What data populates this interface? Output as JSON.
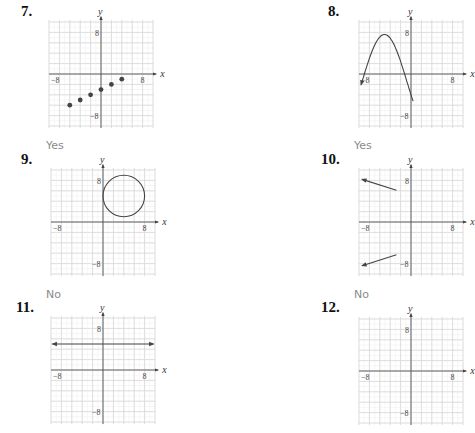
{
  "problems": [
    {
      "number": "7.",
      "answer": "Yes",
      "graph": {
        "type": "scatter",
        "points": [
          [
            -6,
            -6
          ],
          [
            -4,
            -5
          ],
          [
            -2,
            -4
          ],
          [
            0,
            -3
          ],
          [
            2,
            -2
          ],
          [
            4,
            -1
          ]
        ]
      }
    },
    {
      "number": "8.",
      "answer": "Yes",
      "graph": {
        "type": "curve",
        "description": "wave with arrow on left, peak near (-5,8), crossing x-axis near (-1,0)"
      }
    },
    {
      "number": "9.",
      "answer": "No",
      "graph": {
        "type": "circle",
        "center": [
          4,
          5
        ],
        "radius": 4
      }
    },
    {
      "number": "10.",
      "answer": "No",
      "graph": {
        "type": "two-rays",
        "description": "two rays pointing left, one above and one below x-axis"
      }
    },
    {
      "number": "11.",
      "answer": "",
      "graph": {
        "type": "horizontal-line",
        "y": 5
      }
    },
    {
      "number": "12.",
      "answer": "",
      "graph": {
        "type": "blank"
      }
    }
  ],
  "axes": {
    "x_label": "x",
    "y_label": "y",
    "tick_neg": "−8",
    "tick_pos": "8",
    "range": [
      -10,
      10
    ],
    "grid_step": 2
  },
  "chart_data": [
    {
      "type": "scatter",
      "title": "7.",
      "x": [
        -6,
        -4,
        -2,
        0,
        2,
        4
      ],
      "y": [
        -6,
        -5,
        -4,
        -3,
        -2,
        -1
      ],
      "xlim": [
        -10,
        10
      ],
      "ylim": [
        -10,
        10
      ],
      "xlabel": "x",
      "ylabel": "y",
      "grid": true,
      "answer": "Yes"
    },
    {
      "type": "line",
      "title": "8.",
      "description": "sinusoidal curve, partially visible",
      "xlim": [
        -10,
        10
      ],
      "ylim": [
        -10,
        10
      ],
      "grid": true,
      "answer": "Yes"
    },
    {
      "type": "line",
      "title": "9.",
      "description": "circle centered (4,5) radius 4",
      "xlim": [
        -10,
        10
      ],
      "ylim": [
        -10,
        10
      ],
      "grid": true,
      "answer": "No"
    },
    {
      "type": "line",
      "title": "10.",
      "description": "two rays, partially visible",
      "xlim": [
        -10,
        10
      ],
      "ylim": [
        -10,
        10
      ],
      "grid": true,
      "answer": "No"
    },
    {
      "type": "line",
      "title": "11.",
      "description": "horizontal line y=5",
      "xlim": [
        -10,
        10
      ],
      "ylim": [
        -10,
        10
      ],
      "grid": true
    },
    {
      "type": "line",
      "title": "12.",
      "description": "partially visible blank grid",
      "xlim": [
        -10,
        10
      ],
      "ylim": [
        -10,
        10
      ],
      "grid": true
    }
  ]
}
